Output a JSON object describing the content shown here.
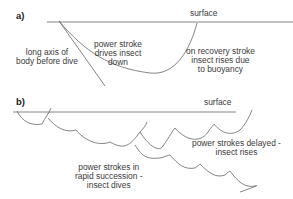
{
  "panels": {
    "a": {
      "label": "a)",
      "surface_label": "surface",
      "axis_label_1": "long axis of",
      "axis_label_2": "body before dive",
      "power_label_1": "power stroke",
      "power_label_2": "drives insect",
      "power_label_3": "down",
      "recovery_label_1": "on recovery stroke",
      "recovery_label_2": "insect rises due",
      "recovery_label_3": "to buoyancy"
    },
    "b": {
      "label": "b)",
      "surface_label": "surface",
      "delayed_label_1": "power strokes delayed -",
      "delayed_label_2": "insect rises",
      "rapid_label_1": "power strokes in",
      "rapid_label_2": "rapid succession -",
      "rapid_label_3": "insect dives"
    }
  },
  "colors": {
    "line": "#555555",
    "text": "#3a3a3a"
  }
}
